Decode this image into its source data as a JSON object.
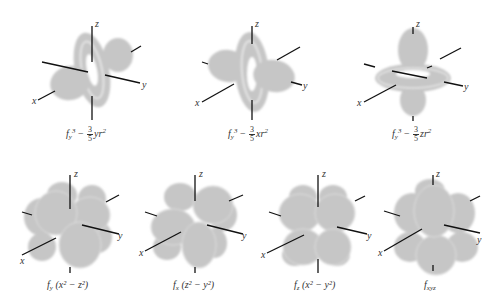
{
  "figure": {
    "lobe_color": "#c6c6c6",
    "ring_highlight": "#e4e4e4",
    "axis_color": "#111111",
    "axis_labels": {
      "x": "x",
      "y": "y",
      "z": "z"
    },
    "orbitals": [
      {
        "id": "fy3-yr2",
        "row": 1,
        "caption": {
          "f": "f",
          "sub": "y",
          "sup": "3",
          "minus": "−",
          "num": "3",
          "den": "5",
          "tail": "yr",
          "tail_sup": "2"
        }
      },
      {
        "id": "fy3-xr2",
        "row": 1,
        "caption": {
          "f": "f",
          "sub": "y",
          "sup": "3",
          "minus": "−",
          "num": "3",
          "den": "5",
          "tail": "xr",
          "tail_sup": "2"
        }
      },
      {
        "id": "fy3-zr2",
        "row": 1,
        "caption": {
          "f": "f",
          "sub": "y",
          "sup": "3",
          "minus": "−",
          "num": "3",
          "den": "5",
          "tail": "zr",
          "tail_sup": "2"
        }
      },
      {
        "id": "fy-x2-z2",
        "row": 2,
        "caption": {
          "f": "f",
          "sub": "y",
          "rest": " (x² − z²)"
        }
      },
      {
        "id": "fx-z2-y2",
        "row": 2,
        "caption": {
          "f": "f",
          "sub": "x",
          "rest": " (z² − y²)"
        }
      },
      {
        "id": "fz-x2-y2",
        "row": 2,
        "caption": {
          "f": "f",
          "sub": "z",
          "rest": " (x² − y²)"
        }
      },
      {
        "id": "fxyz",
        "row": 2,
        "caption": {
          "f": "f",
          "sub": "xyz",
          "rest": ""
        }
      }
    ]
  }
}
